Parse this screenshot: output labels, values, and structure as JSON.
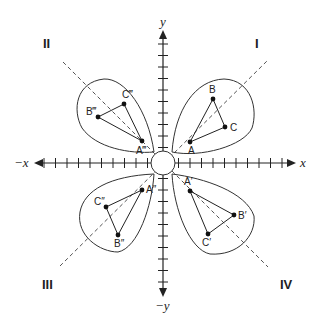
{
  "diagram": {
    "origin": [
      163,
      163
    ],
    "tick_spacing": 11.5,
    "axes": {
      "x_pos_label": "x",
      "x_neg_label": "−x",
      "y_pos_label": "y",
      "y_neg_label": "−y"
    },
    "quadrants": [
      {
        "label": "I",
        "pos": [
          257,
          44
        ]
      },
      {
        "label": "II",
        "pos": [
          46,
          44
        ]
      },
      {
        "label": "III",
        "pos": [
          46,
          285
        ]
      },
      {
        "label": "IV",
        "pos": [
          283,
          285
        ]
      }
    ],
    "triangles": [
      {
        "name": "quadrant-i-triangle",
        "points": {
          "A": [
            190,
            142
          ],
          "B": [
            213,
            99
          ],
          "C": [
            225,
            127
          ]
        },
        "labels": {
          "A": "A",
          "B": "B",
          "C": "C"
        }
      },
      {
        "name": "quadrant-ii-triangle",
        "points": {
          "A": [
            142,
            141
          ],
          "B": [
            98,
            117
          ],
          "C": [
            124,
            104
          ]
        },
        "labels": {
          "A": "A‴",
          "B": "B‴",
          "C": "C‴"
        }
      },
      {
        "name": "quadrant-iii-triangle",
        "points": {
          "A": [
            142,
            190
          ],
          "B": [
            118,
            235
          ],
          "C": [
            106,
            207
          ]
        },
        "labels": {
          "A": "A″",
          "B": "B″",
          "C": "C″"
        }
      },
      {
        "name": "quadrant-iv-triangle",
        "points": {
          "A": [
            190,
            191
          ],
          "B": [
            234,
            215
          ],
          "C": [
            208,
            234
          ]
        },
        "labels": {
          "A": "A′",
          "B": "B′",
          "C": "C′"
        }
      }
    ]
  }
}
